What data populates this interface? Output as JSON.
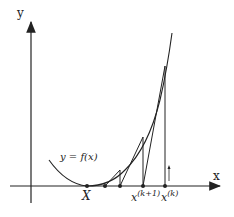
{
  "diagram": {
    "axes": {
      "x_label": "x",
      "y_label": "y"
    },
    "curve_label": "y = f(x)",
    "points": [
      {
        "name": "root",
        "label": "X"
      },
      {
        "name": "x_k_plus_1",
        "label": "x",
        "superscript": "(k+1)"
      },
      {
        "name": "x_k",
        "label": "x",
        "superscript": "(k)"
      }
    ],
    "colors": {
      "line": "#222222",
      "background": "#ffffff"
    }
  }
}
